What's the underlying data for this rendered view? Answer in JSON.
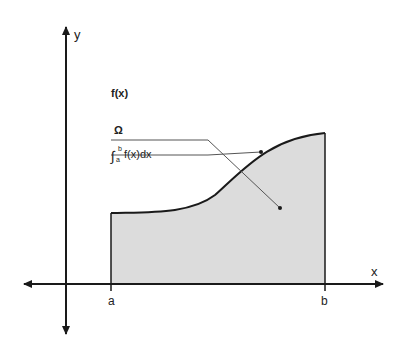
{
  "diagram": {
    "type": "definite-integral-area",
    "axes": {
      "x_label": "x",
      "y_label": "y"
    },
    "bounds": {
      "lower": "a",
      "upper": "b"
    },
    "callouts": {
      "function_label": "f(x)",
      "region_label": "Ω",
      "integral_label": "f(x)dx",
      "integral_lower": "a",
      "integral_upper": "b",
      "integral_sign": "∫"
    },
    "colors": {
      "fill": "#dcdcdc",
      "stroke": "#1a1a1a",
      "leader": "#555555"
    }
  }
}
